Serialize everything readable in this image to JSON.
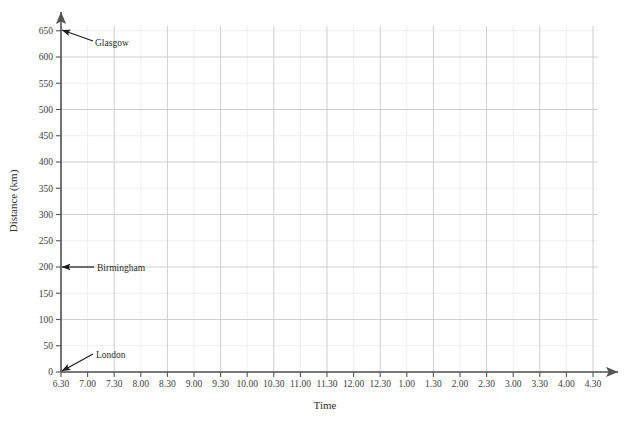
{
  "chart_data": {
    "type": "scatter",
    "title": "",
    "xlabel": "Time",
    "ylabel": "Distance (km)",
    "grid": true,
    "legend": "none",
    "xlim": [
      0,
      20
    ],
    "ylim": [
      0,
      650
    ],
    "x_tick_labels": [
      "6.30",
      "7.00",
      "7.30",
      "8.00",
      "8.30",
      "9.00",
      "9.30",
      "10.00",
      "10.30",
      "11.00",
      "11.30",
      "12.00",
      "12.30",
      "1.00",
      "1.30",
      "2.00",
      "2.30",
      "3.00",
      "3.30",
      "4.00",
      "4.30"
    ],
    "y_tick_labels": [
      "0",
      "50",
      "100",
      "150",
      "200",
      "250",
      "300",
      "350",
      "400",
      "450",
      "500",
      "550",
      "600",
      "650"
    ],
    "y_tick_values": [
      0,
      50,
      100,
      150,
      200,
      250,
      300,
      350,
      400,
      450,
      500,
      550,
      600,
      650
    ],
    "series": [],
    "annotations": [
      {
        "label": "Glasgow",
        "y_value": 650,
        "x_value": 0,
        "label_x": 95,
        "label_y": 46,
        "arrow_from_x": 93,
        "arrow_from_y": 41,
        "arrow_to_x": 62,
        "arrow_to_y": 30
      },
      {
        "label": "Birmingham",
        "y_value": 200,
        "x_value": 0,
        "label_x": 97,
        "label_y": 271,
        "arrow_from_x": 94,
        "arrow_from_y": 267,
        "arrow_to_x": 62,
        "arrow_to_y": 267
      },
      {
        "label": "London",
        "y_value": 0,
        "x_value": 0,
        "label_x": 96,
        "label_y": 358,
        "arrow_from_x": 93,
        "arrow_from_y": 354,
        "arrow_to_x": 62,
        "arrow_to_y": 371
      }
    ],
    "colors": {
      "background": "#ffffff",
      "grid_major": "#cfcfcf",
      "grid_minor": "#efefef",
      "axis": "#555555",
      "text": "#2e2e2e",
      "annotation": "#1c1c1c"
    }
  }
}
